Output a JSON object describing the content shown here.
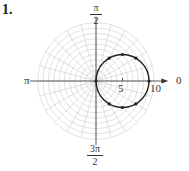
{
  "problem_number": "1.",
  "labels": {
    "top_num": "π",
    "top_den": "2",
    "left": "π",
    "right": "0",
    "bottom_num": "3π",
    "bottom_den": "2",
    "tick_5": "5",
    "tick_10": "10"
  },
  "chart_data": {
    "type": "polar",
    "title": "",
    "rmax": 11,
    "ring_step": 1,
    "angle_step_deg": 15,
    "axis_labels": [
      "0",
      "π/2",
      "π",
      "3π/2"
    ],
    "radial_tick_labels": [
      "5",
      "10"
    ],
    "curve": "r = 10 cos θ (circle of diameter 10 centered at (5,0))",
    "points": [
      {
        "r": 0,
        "theta": "π/2"
      },
      {
        "r": 10,
        "theta": "0"
      },
      {
        "r": 8.66,
        "theta": "π/6"
      },
      {
        "r": 7.07,
        "theta": "π/4"
      },
      {
        "r": 5,
        "theta": "π/3"
      },
      {
        "r": 8.66,
        "theta": "-π/6"
      },
      {
        "r": 7.07,
        "theta": "-π/4"
      },
      {
        "r": 5,
        "theta": "-π/3"
      }
    ]
  }
}
